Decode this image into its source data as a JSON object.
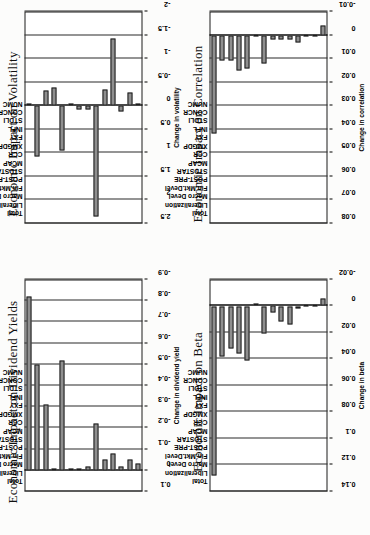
{
  "figure": {
    "categories": [
      "NUMC",
      "CONCR",
      "STDLI",
      "INFL",
      "FXY",
      "XMGDP",
      "CCR",
      "MCAP",
      "STDSTAR",
      "POST-PRE",
      "Fin.Mkt.Devel",
      "Macro Devel",
      "Liberalization",
      "Total"
    ]
  },
  "charts": [
    {
      "id": "volatility",
      "title": "Economic Impact on Volatility",
      "ylabel": "Change in volatility",
      "ticks": [
        "2.5",
        "2",
        "1.5",
        "1",
        "0.5",
        "0",
        "-0.5",
        "-1",
        "-1.5",
        "-2"
      ],
      "min": -2,
      "max": 2.5,
      "values": [
        -0.02,
        -0.28,
        0.12,
        -1.42,
        -0.35,
        2.35,
        0.07,
        0.09,
        0.0,
        0.95,
        -0.38,
        -0.33,
        1.08,
        -0.03
      ]
    },
    {
      "id": "correlation",
      "title": "Economic Impact on Correlation",
      "ylabel": "Change in correlation",
      "ticks": [
        "0.08",
        "0.07",
        "0.06",
        "0.05",
        "0.04",
        "0.03",
        "0.02",
        "0.01",
        "0",
        "-0.01"
      ],
      "min": -0.01,
      "max": 0.08,
      "values": [
        -0.004,
        0.0005,
        0.0008,
        0.003,
        0.002,
        0.002,
        0.002,
        0.012,
        0.0005,
        0.014,
        0.015,
        0.011,
        0.011,
        0.042
      ]
    },
    {
      "id": "dividend",
      "title": "Economic Impact on Dividend Yields",
      "ylabel": "Change in dividend yield",
      "ticks": [
        "0.1",
        "0",
        "-0.1",
        "-0.2",
        "-0.3",
        "-0.4",
        "-0.5",
        "-0.6",
        "-0.7",
        "-0.8",
        "-0.9"
      ],
      "min": -0.9,
      "max": 0.1,
      "values": [
        -0.03,
        -0.05,
        -0.02,
        -0.08,
        -0.05,
        -0.22,
        -0.02,
        0.0,
        0.0,
        -0.52,
        -0.01,
        -0.31,
        -0.5,
        -0.82
      ]
    },
    {
      "id": "beta",
      "title": "Economic Impact on Beta",
      "ylabel": "Change in beta",
      "ticks": [
        "0.14",
        "0.12",
        "0.1",
        "0.08",
        "0.06",
        "0.04",
        "0.02",
        "0",
        "-0.02"
      ],
      "min": -0.02,
      "max": 0.14,
      "values": [
        -0.006,
        0.0004,
        0.0006,
        0.002,
        0.014,
        0.012,
        0.005,
        0.021,
        0.0,
        0.041,
        0.036,
        0.032,
        0.038,
        0.128
      ]
    }
  ],
  "chart_data": [
    {
      "type": "bar",
      "title": "Economic Impact on Volatility",
      "xlabel": "",
      "ylabel": "Change in volatility",
      "orientation": "horizontal",
      "grid": true,
      "legend": "none",
      "categories": [
        "NUMC",
        "CONCR",
        "STDLI",
        "INFL",
        "FXY",
        "XMGDP",
        "CCR",
        "MCAP",
        "STDSTAR",
        "POST-PRE",
        "Fin.Mkt.Devel",
        "Macro Devel",
        "Liberalization",
        "Total"
      ],
      "values": [
        -0.02,
        -0.28,
        0.12,
        -1.42,
        -0.35,
        2.35,
        0.07,
        0.09,
        0.0,
        0.95,
        -0.38,
        -0.33,
        1.08,
        -0.03
      ],
      "ylim": [
        -2,
        2.5
      ],
      "ticks": [
        "2.5",
        "2",
        "1.5",
        "1",
        "0.5",
        "0",
        "-0.5",
        "-1",
        "-1.5",
        "-2"
      ]
    },
    {
      "type": "bar",
      "title": "Economic Impact on Correlation",
      "xlabel": "",
      "ylabel": "Change in correlation",
      "orientation": "horizontal",
      "grid": true,
      "legend": "none",
      "categories": [
        "NUMC",
        "CONCR",
        "STDLI",
        "INFL",
        "FXY",
        "XMGDP",
        "CCR",
        "MCAP",
        "STDSTAR",
        "POST-PRE",
        "Fin.Mkt.Devel",
        "Macro Devel",
        "Liberalization",
        "Total"
      ],
      "values": [
        -0.004,
        0.0005,
        0.0008,
        0.003,
        0.002,
        0.002,
        0.002,
        0.012,
        0.0005,
        0.014,
        0.015,
        0.011,
        0.011,
        0.042
      ],
      "ylim": [
        -0.01,
        0.08
      ],
      "ticks": [
        "0.08",
        "0.07",
        "0.06",
        "0.05",
        "0.04",
        "0.03",
        "0.02",
        "0.01",
        "0",
        "-0.01"
      ]
    },
    {
      "type": "bar",
      "title": "Economic Impact on Dividend Yields",
      "xlabel": "",
      "ylabel": "Change in dividend yield",
      "orientation": "horizontal",
      "grid": true,
      "legend": "none",
      "categories": [
        "NUMC",
        "CONCR",
        "STDLI",
        "INFL",
        "FXY",
        "XMGDP",
        "CCR",
        "MCAP",
        "STDSTAR",
        "POST-PRE",
        "Fin.Mkt.Devel",
        "Macro Devel",
        "Liberalization",
        "Total"
      ],
      "values": [
        -0.03,
        -0.05,
        -0.02,
        -0.08,
        -0.05,
        -0.22,
        -0.02,
        0.0,
        0.0,
        -0.52,
        -0.01,
        -0.31,
        -0.5,
        -0.82
      ],
      "ylim": [
        -0.9,
        0.1
      ],
      "ticks": [
        "0.1",
        "0",
        "-0.1",
        "-0.2",
        "-0.3",
        "-0.4",
        "-0.5",
        "-0.6",
        "-0.7",
        "-0.8",
        "-0.9"
      ]
    },
    {
      "type": "bar",
      "title": "Economic Impact on Beta",
      "xlabel": "",
      "ylabel": "Change in beta",
      "orientation": "horizontal",
      "grid": true,
      "legend": "none",
      "categories": [
        "NUMC",
        "CONCR",
        "STDLI",
        "INFL",
        "FXY",
        "XMGDP",
        "CCR",
        "MCAP",
        "STDSTAR",
        "POST-PRE",
        "Fin.Mkt.Devel",
        "Macro Devel",
        "Liberalization",
        "Total"
      ],
      "values": [
        -0.006,
        0.0004,
        0.0006,
        0.002,
        0.014,
        0.012,
        0.005,
        0.021,
        0.0,
        0.041,
        0.036,
        0.032,
        0.038,
        0.128
      ],
      "ylim": [
        -0.02,
        0.14
      ],
      "ticks": [
        "0.14",
        "0.12",
        "0.1",
        "0.08",
        "0.06",
        "0.04",
        "0.02",
        "0",
        "-0.02"
      ]
    }
  ]
}
